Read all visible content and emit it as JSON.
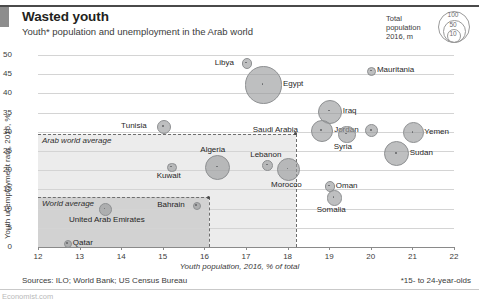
{
  "header": {
    "title": "Wasted youth",
    "subtitle": "Youth* population and unemployment in the Arab world"
  },
  "legend": {
    "line1": "Total",
    "line2": "population",
    "line3": "2016, m",
    "sizes": [
      "100",
      "50",
      "10"
    ]
  },
  "footer": {
    "sources": "Sources: ILO; World Bank; US Census Bureau",
    "note": "*15- to 24-year-olds",
    "watermark": "Economist.com"
  },
  "annotations": {
    "arab_world_average": "Arab world average",
    "world_average": "World average"
  },
  "chart_data": {
    "type": "scatter",
    "title": "Wasted youth",
    "subtitle": "Youth* population and unemployment in the Arab world",
    "xlabel": "Youth population, 2016, % of total",
    "ylabel": "Youth unemployment rate, 2016, %",
    "xlim": [
      12,
      22
    ],
    "ylim": [
      0,
      50
    ],
    "xticks": [
      "12",
      "13",
      "14",
      "15",
      "16",
      "17",
      "18",
      "19",
      "20",
      "21",
      "22"
    ],
    "yticks": [
      "0",
      "5",
      "10",
      "15",
      "20",
      "25",
      "30",
      "35",
      "40",
      "45",
      "50"
    ],
    "grid": "horizontal",
    "size_encoding": "Total population, 2016, m",
    "size_legend": [
      100,
      50,
      10
    ],
    "reference_bands": [
      {
        "label": "Arab world average",
        "x": 18.2,
        "y": 29.5
      },
      {
        "label": "World average",
        "x": 16.1,
        "y": 13.0
      }
    ],
    "points": [
      {
        "name": "Libya",
        "x": 17.0,
        "y": 48.0,
        "pop": 6,
        "label_pos": "left"
      },
      {
        "name": "Mauritania",
        "x": 20.0,
        "y": 46.0,
        "pop": 4,
        "label_pos": "right"
      },
      {
        "name": "Egypt",
        "x": 17.4,
        "y": 42.5,
        "pop": 95,
        "label_pos": "right"
      },
      {
        "name": "Iraq",
        "x": 19.0,
        "y": 35.5,
        "pop": 37,
        "label_pos": "right"
      },
      {
        "name": "Tunisia",
        "x": 15.0,
        "y": 31.5,
        "pop": 11,
        "label_pos": "left"
      },
      {
        "name": "Saudi Arabia",
        "x": 18.8,
        "y": 30.5,
        "pop": 32,
        "label_pos": "left"
      },
      {
        "name": "Jordan",
        "x": 20.0,
        "y": 30.5,
        "pop": 9,
        "label_pos": "left"
      },
      {
        "name": "Yemen",
        "x": 21.0,
        "y": 30.0,
        "pop": 27,
        "label_pos": "right"
      },
      {
        "name": "Syria",
        "x": 19.4,
        "y": 29.5,
        "pop": 18,
        "label_pos": "below"
      },
      {
        "name": "Sudan",
        "x": 20.6,
        "y": 24.5,
        "pop": 40,
        "label_pos": "right"
      },
      {
        "name": "Lebanon",
        "x": 17.5,
        "y": 21.5,
        "pop": 6,
        "label_pos": "above"
      },
      {
        "name": "Algeria",
        "x": 16.3,
        "y": 21.0,
        "pop": 40,
        "label_pos": "above"
      },
      {
        "name": "Morocco",
        "x": 18.0,
        "y": 20.5,
        "pop": 34,
        "label_pos": "below"
      },
      {
        "name": "Kuwait",
        "x": 15.2,
        "y": 21.0,
        "pop": 4,
        "label_pos": "below"
      },
      {
        "name": "Oman",
        "x": 19.0,
        "y": 16.0,
        "pop": 5,
        "label_pos": "right"
      },
      {
        "name": "Somalia",
        "x": 19.1,
        "y": 13.0,
        "pop": 14,
        "label_pos": "below"
      },
      {
        "name": "Bahrain",
        "x": 15.8,
        "y": 11.0,
        "pop": 1.4,
        "label_pos": "left"
      },
      {
        "name": "United Arab Emirates",
        "x": 13.6,
        "y": 10.0,
        "pop": 9,
        "label_pos": "below-right"
      },
      {
        "name": "Qatar",
        "x": 12.7,
        "y": 1.0,
        "pop": 2.3,
        "label_pos": "right"
      }
    ]
  }
}
